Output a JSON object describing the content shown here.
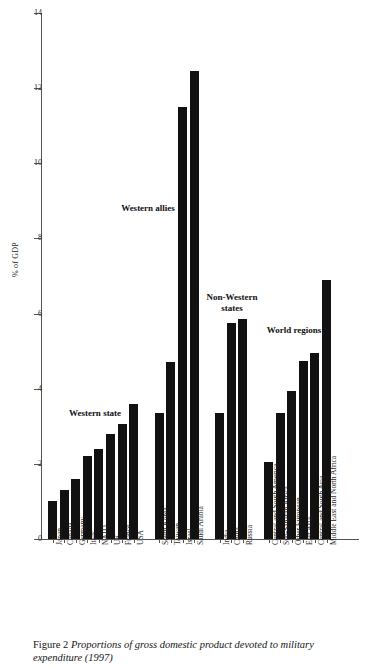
{
  "figure": {
    "caption_label": "Figure 2",
    "caption_text": "Proportions of gross domestic product devoted to military expenditure (1997)"
  },
  "chart_data": {
    "type": "bar",
    "title": "",
    "xlabel": "",
    "ylabel": "% of GDP",
    "ylim": [
      0,
      14
    ],
    "ytick_values": [
      0,
      2,
      4,
      6,
      8,
      10,
      12,
      14
    ],
    "ytick_labels": [
      "0",
      "2",
      "4",
      "6",
      "8",
      "10",
      "12",
      "14"
    ],
    "grid": false,
    "legend": "none",
    "categories": [
      "Japan",
      "Canada",
      "Germany",
      "Italy",
      "NATO",
      "UK",
      "France",
      "USA",
      "South Korea",
      "Taiwan",
      "Israel",
      "Saudi Arabia",
      "India",
      "China",
      "Russia",
      "Central and South America",
      "Sub-Saharan Africa",
      "Other European",
      "East Asia",
      "Central and South Asia",
      "Middle East and North Africa"
    ],
    "values": [
      1.0,
      1.3,
      1.6,
      2.2,
      2.4,
      2.8,
      3.05,
      3.6,
      3.35,
      4.7,
      11.5,
      12.45,
      3.35,
      5.75,
      5.85,
      2.05,
      3.35,
      3.95,
      4.75,
      4.95,
      6.9
    ],
    "groups": [
      {
        "note": "Western state",
        "members": [
          "Japan",
          "Canada",
          "Germany",
          "Italy",
          "NATO",
          "UK",
          "France",
          "USA"
        ]
      },
      {
        "note": "Western allies",
        "members": [
          "South Korea",
          "Taiwan",
          "Israel",
          "Saudi Arabia"
        ]
      },
      {
        "note": "Non-Western states",
        "members": [
          "India",
          "China",
          "Russia"
        ]
      },
      {
        "note": "World regions",
        "members": [
          "Central and South America",
          "Sub-Saharan Africa",
          "Other European",
          "East Asia",
          "Central and South Asia",
          "Middle East and North Africa"
        ]
      }
    ],
    "annotations": [
      {
        "text": "Western state",
        "x": 95,
        "y": 408
      },
      {
        "text": "Western allies",
        "x": 148,
        "y": 203
      },
      {
        "text": "Non-Western states",
        "x": 232,
        "y": 292
      },
      {
        "text": "World regions",
        "x": 294,
        "y": 325
      }
    ],
    "bar_color": "#111111",
    "axis_color": "#555555"
  }
}
